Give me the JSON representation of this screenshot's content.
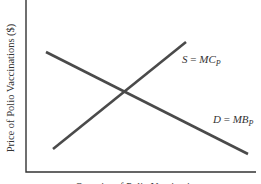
{
  "chart_data": {
    "type": "line",
    "title": "",
    "xlabel": "Quantity of Polio Vaccinations",
    "ylabel": "Price of Polio Vaccinations ($)",
    "grid": false,
    "legend": "none",
    "ticks": false,
    "series": [
      {
        "name": "S = MC_P",
        "label_main": "S",
        "label_eq": " = ",
        "label_var": "MC",
        "label_sub": "P",
        "slope": "upward",
        "points": [
          [
            0.12,
            0.14
          ],
          [
            0.7,
            0.8
          ]
        ],
        "pixel_points": [
          [
            53,
            149
          ],
          [
            186,
            42
          ]
        ]
      },
      {
        "name": "D = MB_P",
        "label_main": "D",
        "label_eq": " = ",
        "label_var": "MB",
        "label_sub": "P",
        "slope": "downward",
        "points": [
          [
            0.09,
            0.74
          ],
          [
            0.98,
            0.11
          ]
        ],
        "pixel_points": [
          [
            46,
            52
          ],
          [
            248,
            154
          ]
        ]
      }
    ],
    "intersection": {
      "label": "equilibrium",
      "pixel": [
        125,
        91
      ]
    }
  },
  "axes": {
    "origin_px": [
      26,
      172
    ],
    "x_end_px": 256,
    "y_top_px": 0
  }
}
